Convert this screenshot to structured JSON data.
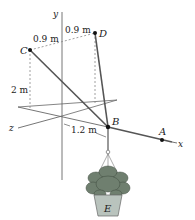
{
  "figure": {
    "type": "3D statics diagram",
    "axes": {
      "x": "x",
      "y": "y",
      "z": "z"
    },
    "points": {
      "A": "A",
      "B": "B",
      "C": "C",
      "D": "D",
      "E": "E"
    },
    "dimensions": {
      "c_offset": "0.9 m",
      "d_offset": "0.9 m",
      "c_height": "2 m",
      "b_distance": "1.2 m"
    },
    "colors": {
      "line": "#555555",
      "dashed": "#888888",
      "axis": "#666666",
      "point": "#111111",
      "pot": "#b9c3bd",
      "foliage": "#6f7f6f"
    }
  }
}
